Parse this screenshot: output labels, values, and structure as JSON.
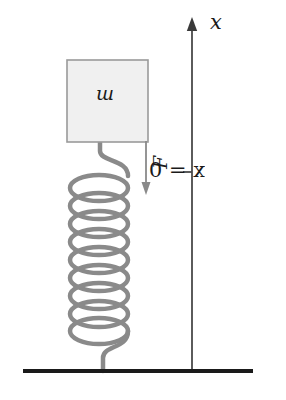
{
  "figure": {
    "kind": "mass-spring-system-diagram",
    "title": "",
    "background_color": "#ffffff"
  },
  "labels": {
    "mass": "m",
    "force": "F",
    "axis": "x",
    "origin": "x = 0",
    "origin_rendered": "0 = x"
  },
  "colors": {
    "spring": "#8a8a8a",
    "box_fill": "#f0f0f0",
    "box_stroke": "#9a9a9a",
    "ground": "#1a1a1a",
    "axis": "#4a4a4a",
    "arrow": "#8a8a8a",
    "text": "#1a1a1a"
  },
  "geometry": {
    "mass_box": {
      "x": 67,
      "y": 60,
      "width": 81,
      "height": 82
    },
    "spring": {
      "center_x": 99,
      "coil_half_width": 29,
      "top_y": 175,
      "bottom_y": 340,
      "coil_count": 9,
      "stroke_width": 4.5
    },
    "ground": {
      "x1": 23,
      "x2": 253,
      "y": 371,
      "thickness": 4
    },
    "axis": {
      "x": 192,
      "y_top": 20,
      "y_bottom": 371,
      "tick_y": 172,
      "tick_length": 9
    },
    "force_arrow": {
      "x": 146,
      "y_start": 141,
      "y_end": 194
    }
  },
  "elements": {
    "mass_box_name": "mass block",
    "spring_name": "helical spring",
    "ground_name": "fixed ground support",
    "axis_name": "vertical x axis",
    "force_arrow_name": "applied force arrow"
  }
}
